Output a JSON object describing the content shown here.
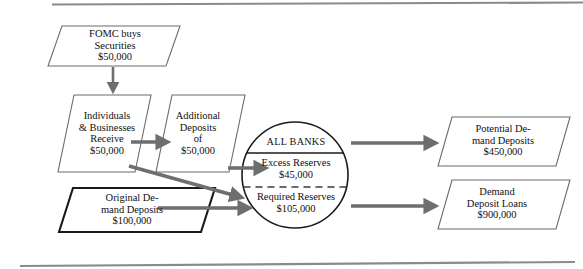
{
  "diagram": {
    "colors": {
      "shape_stroke": "#6b6b6b",
      "shape_stroke_bold": "#1a1a1a",
      "arrow": "#6e6e6e",
      "rule": "#8a8a8a",
      "text": "#111111",
      "background": "#ffffff"
    },
    "nodes": {
      "fomc": {
        "shape": "parallelogram",
        "lines": [
          "FOMC buys",
          "Securities",
          "$50,000"
        ],
        "text": "FOMC buys\nSecurities\n$50,000"
      },
      "individuals": {
        "shape": "parallelogram",
        "lines": [
          "Individuals",
          "& Businesses",
          "Receive",
          "$50,000"
        ],
        "text": "Individuals\n& Businesses\nReceive\n$50,000"
      },
      "additional_deposits": {
        "shape": "parallelogram",
        "lines": [
          "Additional",
          "Deposits",
          "of",
          "$50,000"
        ],
        "text": "Additional\nDeposits\nof\n$50,000"
      },
      "original_deposits": {
        "shape": "parallelogram",
        "emphasis": "bold-border",
        "lines": [
          "Original De-",
          "mand Deposits",
          "$100,000"
        ],
        "text": "Original De-\nmand Deposits\n$100,000"
      },
      "all_banks": {
        "shape": "circle",
        "header": "ALL BANKS",
        "excess_label": "Excess Reserves",
        "excess_value": "$45,000",
        "excess_text": "Excess Reserves\n$45,000",
        "required_label": "Required Reserves",
        "required_value": "$105,000",
        "required_text": "Required Reserves\n$105,000"
      },
      "potential_demand_deposits": {
        "shape": "parallelogram",
        "lines": [
          "Potential De-",
          "mand Deposits",
          "$450,000"
        ],
        "text": "Potential De-\nmand Deposits\n$450,000"
      },
      "demand_deposit_loans": {
        "shape": "parallelogram",
        "lines": [
          "Demand",
          "Deposit Loans",
          "$900,000"
        ],
        "text": "Demand\nDeposit Loans\n$900,000"
      }
    },
    "arrows": [
      {
        "name": "fomc-to-individuals",
        "from": "fomc",
        "to": "individuals",
        "direction": "down"
      },
      {
        "name": "individuals-to-additional",
        "from": "individuals",
        "to": "additional_deposits",
        "direction": "right"
      },
      {
        "name": "additional-to-excess",
        "from": "additional_deposits",
        "to": "all_banks_excess",
        "direction": "right"
      },
      {
        "name": "individuals-to-required",
        "from": "individuals",
        "to": "all_banks_required",
        "direction": "diagonal-down-right"
      },
      {
        "name": "original-to-required",
        "from": "original_deposits",
        "to": "all_banks_required",
        "direction": "right"
      },
      {
        "name": "excess-to-potential",
        "from": "all_banks_excess",
        "to": "potential_demand_deposits",
        "direction": "right"
      },
      {
        "name": "required-to-loans",
        "from": "all_banks_required",
        "to": "demand_deposit_loans",
        "direction": "right"
      }
    ]
  }
}
